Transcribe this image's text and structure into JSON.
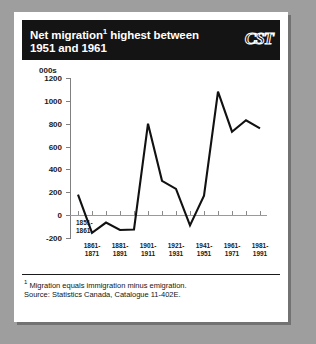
{
  "header": {
    "title_line1": "Net migration",
    "title_footnote_marker": "1",
    "title_line1_cont": " highest between",
    "title_line2": "1951 and 1961",
    "logo": "CST"
  },
  "footer": {
    "footnote_marker": "1",
    "footnote": " Migration equals immigration minus emigration.",
    "source": "Source: Statistics Canada, Catalogue 11-402E."
  },
  "colors": {
    "panel_background": "#ffffff",
    "page_background": "#9e9e9e",
    "titlebar": "#141414",
    "line": "#111111",
    "axis": "#808080"
  },
  "chart_data": {
    "type": "line",
    "title": "Net migration1 highest between 1951 and 1961",
    "xlabel": "",
    "ylabel": "000s",
    "ylim": [
      -200,
      1200
    ],
    "yticks": [
      -200,
      0,
      200,
      400,
      600,
      800,
      1000,
      1200
    ],
    "ytick_labels": [
      "-200",
      "0",
      "200",
      "400",
      "600",
      "800",
      "1000",
      "1200"
    ],
    "grid": false,
    "legend": false,
    "units": "000s",
    "categories": [
      "1851-\n1861",
      "1861-\n1871",
      "1871-\n1881",
      "1881-\n1891",
      "1891-\n1901",
      "1901-\n1911",
      "1911-\n1921",
      "1921-\n1931",
      "1931-\n1941",
      "1941-\n1951",
      "1951-\n1961",
      "1961-\n1971",
      "1971-\n1981",
      "1981-\n1991"
    ],
    "xtick_labels_shown": [
      "1851-\n1861",
      "1861-\n1871",
      "1881-\n1891",
      "1901-\n1911",
      "1921-\n1931",
      "1941-\n1951",
      "1961-\n1971",
      "1981-\n1991"
    ],
    "values": [
      180,
      -155,
      -65,
      -130,
      -125,
      800,
      300,
      230,
      -90,
      170,
      1080,
      730,
      830,
      760
    ]
  }
}
